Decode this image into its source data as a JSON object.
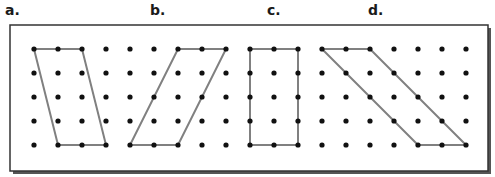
{
  "labels": {
    "a": "a.",
    "b": "b.",
    "c": "c.",
    "d": "d."
  },
  "grid": {
    "columns": 19,
    "rows": 5,
    "origin_x": 34,
    "origin_y": 49,
    "spacing": 24,
    "dot_color": "#111111"
  },
  "frame": {
    "x": 10,
    "y": 25,
    "width": 478,
    "height": 146,
    "border_color": "#333333",
    "shadow_color": "#555555"
  },
  "shapes": [
    {
      "id": "a",
      "name": "parallelogram-a",
      "vertices": [
        [
          0,
          0
        ],
        [
          2,
          0
        ],
        [
          3,
          4
        ],
        [
          1,
          4
        ]
      ]
    },
    {
      "id": "b",
      "name": "parallelogram-b",
      "vertices": [
        [
          6,
          0
        ],
        [
          8,
          0
        ],
        [
          6,
          4
        ],
        [
          4,
          4
        ]
      ]
    },
    {
      "id": "c",
      "name": "rectangle-c",
      "vertices": [
        [
          9,
          0
        ],
        [
          11,
          0
        ],
        [
          11,
          4
        ],
        [
          9,
          4
        ]
      ]
    },
    {
      "id": "d",
      "name": "parallelogram-d",
      "vertices": [
        [
          12,
          0
        ],
        [
          14,
          0
        ],
        [
          18,
          4
        ],
        [
          16,
          4
        ]
      ]
    }
  ],
  "shape_line_color": "#808080"
}
